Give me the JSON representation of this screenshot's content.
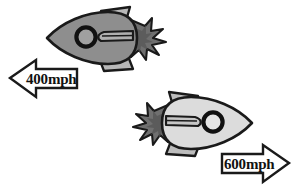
{
  "figure": {
    "title": "",
    "background_color": "#ffffff",
    "width": 299,
    "height": 191
  },
  "objects": [
    {
      "name": "rocket-upper-left",
      "kind": "rocket",
      "direction": "left",
      "body_color": "#8e8e8e",
      "fin_color": "#b8b8b8",
      "flame_color": "#6f6f6f",
      "outline_color": "#1a1a1a",
      "porthole_fill": "#a0a0a0"
    },
    {
      "name": "rocket-lower-right",
      "kind": "rocket",
      "direction": "right",
      "body_color": "#dcdcdc",
      "fin_color": "#bdbdbd",
      "flame_color": "#707070",
      "outline_color": "#1a1a1a",
      "porthole_fill": "#e6e6e6"
    }
  ],
  "arrows": [
    {
      "name": "speed-arrow-left",
      "label": "400mph",
      "direction": "left",
      "fill_color": "#ffffff",
      "outline_color": "#1a1a1a",
      "text_color": "#111111"
    },
    {
      "name": "speed-arrow-right",
      "label": "600mph",
      "direction": "right",
      "fill_color": "#ffffff",
      "outline_color": "#1a1a1a",
      "text_color": "#111111"
    }
  ]
}
